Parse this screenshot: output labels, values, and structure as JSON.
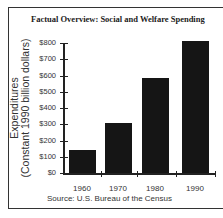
{
  "chart_data": {
    "type": "bar",
    "title": "Factual Overview: Social and Welfare Spending",
    "xlabel": "",
    "ylabel": "Expenditures (Constant 1990 billion dollars)",
    "ylabel_lines": [
      "Expenditures",
      "(Constant 1990 billion dollars)"
    ],
    "categories": [
      "1960",
      "1970",
      "1980",
      "1990"
    ],
    "values": [
      140,
      310,
      585,
      810
    ],
    "ylim": [
      0,
      800
    ],
    "yticks": [
      "$0",
      "$100",
      "$200",
      "$300",
      "$400",
      "$500",
      "$600",
      "$700",
      "$800"
    ],
    "grid": false,
    "bar_color": "#151515",
    "source": "Source: U.S. Bureau of the Census"
  }
}
